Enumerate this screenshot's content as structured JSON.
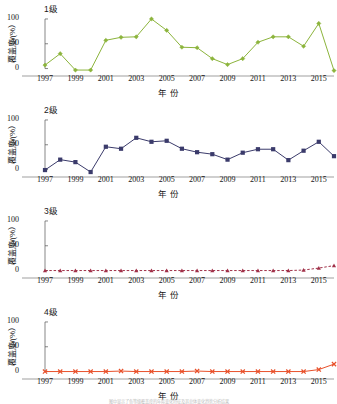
{
  "figure": {
    "xlabel": "年  份",
    "ylabel": "覆盖度/(%）",
    "caption": "图中显示了各等级覆盖度的年际变化特征及其总体变化趋势分析结果",
    "yticks": [
      "0",
      "50",
      "100"
    ],
    "ylim": [
      -15,
      110
    ],
    "xticks": [
      "1997",
      "1999",
      "2001",
      "2003",
      "2005",
      "2007",
      "2009",
      "2011",
      "2013",
      "2015"
    ],
    "xlim": [
      1997,
      2016
    ]
  },
  "chart_data": [
    {
      "type": "line",
      "title": "1级",
      "xlabel": "年  份",
      "ylabel": "覆盖度/(%）",
      "ylim": [
        -15,
        110
      ],
      "xlim": [
        1997,
        2016
      ],
      "grid": false,
      "legend": "none",
      "color": "#8CB43C",
      "marker": "diamond",
      "linestyle": "solid",
      "x": [
        1997,
        1998,
        1999,
        2000,
        2001,
        2002,
        2003,
        2004,
        2005,
        2006,
        2007,
        2008,
        2009,
        2010,
        2011,
        2012,
        2013,
        2014,
        2015,
        2016
      ],
      "values": [
        7,
        30,
        -3,
        -3,
        57,
        63,
        64,
        100,
        77,
        43,
        42,
        20,
        8,
        20,
        53,
        64,
        64,
        45,
        91,
        -4
      ]
    },
    {
      "type": "line",
      "title": "2级",
      "xlabel": "年  份",
      "ylabel": "覆盖度/(%）",
      "ylim": [
        -15,
        110
      ],
      "xlim": [
        1997,
        2016
      ],
      "grid": false,
      "legend": "none",
      "color": "#3B3B6B",
      "marker": "square",
      "linestyle": "solid",
      "x": [
        1997,
        1998,
        1999,
        2000,
        2001,
        2002,
        2003,
        2004,
        2005,
        2006,
        2007,
        2008,
        2009,
        2010,
        2011,
        2012,
        2013,
        2014,
        2015,
        2016
      ],
      "values": [
        -1,
        20,
        15,
        -5,
        46,
        42,
        64,
        56,
        58,
        42,
        35,
        31,
        20,
        34,
        41,
        41,
        19,
        38,
        56,
        27
      ]
    },
    {
      "type": "line",
      "title": "3级",
      "xlabel": "年  份",
      "ylabel": "覆盖度/(%）",
      "ylim": [
        -15,
        110
      ],
      "xlim": [
        1997,
        2016
      ],
      "grid": false,
      "legend": "none",
      "color": "#A03048",
      "marker": "triangle",
      "linestyle": "dashed",
      "x": [
        1997,
        1998,
        1999,
        2000,
        2001,
        2002,
        2003,
        2004,
        2005,
        2006,
        2007,
        2008,
        2009,
        2010,
        2011,
        2012,
        2013,
        2014,
        2015,
        2016
      ],
      "values": [
        0,
        0,
        0,
        0,
        0,
        0,
        0,
        0,
        0,
        0,
        0,
        0,
        0,
        0,
        0,
        0,
        0,
        1,
        5,
        10
      ]
    },
    {
      "type": "line",
      "title": "4级",
      "xlabel": "年  份",
      "ylabel": "覆盖度/(%）",
      "ylim": [
        -15,
        110
      ],
      "xlim": [
        1997,
        2016
      ],
      "grid": false,
      "legend": "none",
      "color": "#E8502A",
      "marker": "cross",
      "linestyle": "solid",
      "x": [
        1997,
        1998,
        1999,
        2000,
        2001,
        2002,
        2003,
        2004,
        2005,
        2006,
        2007,
        2008,
        2009,
        2010,
        2011,
        2012,
        2013,
        2014,
        2015,
        2016
      ],
      "values": [
        0,
        0,
        0,
        0,
        0,
        1,
        0,
        0,
        0,
        0,
        1,
        0,
        0,
        0,
        0,
        0,
        0,
        0,
        4,
        15
      ]
    }
  ]
}
